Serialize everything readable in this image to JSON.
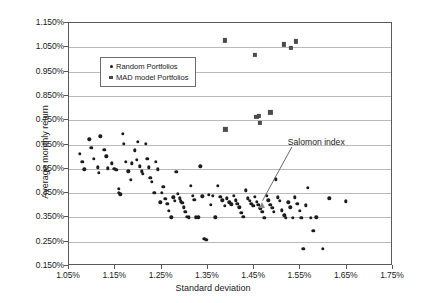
{
  "chart_data": {
    "type": "scatter",
    "title": "",
    "xlabel": "Standard deviation",
    "ylabel": "Average monthly return",
    "xlim": [
      1.05,
      1.75
    ],
    "ylim": [
      0.15,
      1.15
    ],
    "xticks": [
      "1.05%",
      "1.15%",
      "1.25%",
      "1.35%",
      "1.45%",
      "1.55%",
      "1.65%",
      "1.75%"
    ],
    "xtick_values": [
      1.05,
      1.15,
      1.25,
      1.35,
      1.45,
      1.55,
      1.65,
      1.75
    ],
    "yticks": [
      "0.150%",
      "0.250%",
      "0.350%",
      "0.450%",
      "0.550%",
      "0.650%",
      "0.750%",
      "0.850%",
      "0.950%",
      "1.050%",
      "1.150%"
    ],
    "ytick_values": [
      0.15,
      0.25,
      0.35,
      0.45,
      0.55,
      0.65,
      0.75,
      0.85,
      0.95,
      1.05,
      1.15
    ],
    "grid": true,
    "legend_position": "upper-left-inside",
    "legend": [
      {
        "label": "Random Portfolios",
        "marker": "diamond",
        "color": "#1c1c1c"
      },
      {
        "label": "MAD model Portfolios",
        "marker": "square",
        "color": "#4b4b4b"
      }
    ],
    "annotations": [
      {
        "text": "Salomon index",
        "marker": "triangle",
        "marker_color": "#8a8a8a",
        "point": [
          1.468,
          0.402
        ],
        "label_at": [
          1.525,
          0.652
        ]
      }
    ],
    "series": [
      {
        "name": "Random Portfolios",
        "marker": "diamond",
        "color": "#1c1c1c",
        "points": [
          [
            1.073,
            0.612
          ],
          [
            1.079,
            0.578
          ],
          [
            1.083,
            0.548
          ],
          [
            1.094,
            0.672
          ],
          [
            1.098,
            0.636
          ],
          [
            1.104,
            0.592
          ],
          [
            1.112,
            0.556
          ],
          [
            1.115,
            0.534
          ],
          [
            1.118,
            0.684
          ],
          [
            1.126,
            0.628
          ],
          [
            1.131,
            0.601
          ],
          [
            1.134,
            0.552
          ],
          [
            1.142,
            0.572
          ],
          [
            1.148,
            0.551
          ],
          [
            1.152,
            0.546
          ],
          [
            1.157,
            0.467
          ],
          [
            1.158,
            0.452
          ],
          [
            1.161,
            0.445
          ],
          [
            1.166,
            0.694
          ],
          [
            1.169,
            0.652
          ],
          [
            1.173,
            0.578
          ],
          [
            1.178,
            0.54
          ],
          [
            1.183,
            0.505
          ],
          [
            1.186,
            0.572
          ],
          [
            1.192,
            0.626
          ],
          [
            1.196,
            0.588
          ],
          [
            1.199,
            0.662
          ],
          [
            1.203,
            0.56
          ],
          [
            1.207,
            0.54
          ],
          [
            1.21,
            0.529
          ],
          [
            1.216,
            0.654
          ],
          [
            1.219,
            0.592
          ],
          [
            1.222,
            0.556
          ],
          [
            1.226,
            0.512
          ],
          [
            1.229,
            0.497
          ],
          [
            1.234,
            0.452
          ],
          [
            1.238,
            0.578
          ],
          [
            1.242,
            0.548
          ],
          [
            1.247,
            0.412
          ],
          [
            1.251,
            0.45
          ],
          [
            1.254,
            0.475
          ],
          [
            1.258,
            0.427
          ],
          [
            1.262,
            0.405
          ],
          [
            1.266,
            0.378
          ],
          [
            1.271,
            0.35
          ],
          [
            1.275,
            0.432
          ],
          [
            1.278,
            0.418
          ],
          [
            1.282,
            0.538
          ],
          [
            1.285,
            0.446
          ],
          [
            1.289,
            0.428
          ],
          [
            1.292,
            0.416
          ],
          [
            1.295,
            0.409
          ],
          [
            1.298,
            0.392
          ],
          [
            1.301,
            0.374
          ],
          [
            1.305,
            0.352
          ],
          [
            1.309,
            0.35
          ],
          [
            1.313,
            0.48
          ],
          [
            1.317,
            0.438
          ],
          [
            1.321,
            0.423
          ],
          [
            1.324,
            0.35
          ],
          [
            1.329,
            0.351
          ],
          [
            1.334,
            0.56
          ],
          [
            1.338,
            0.437
          ],
          [
            1.342,
            0.262
          ],
          [
            1.347,
            0.258
          ],
          [
            1.352,
            0.442
          ],
          [
            1.356,
            0.402
          ],
          [
            1.361,
            0.439
          ],
          [
            1.366,
            0.35
          ],
          [
            1.372,
            0.48
          ],
          [
            1.377,
            0.435
          ],
          [
            1.381,
            0.42
          ],
          [
            1.386,
            0.398
          ],
          [
            1.391,
            0.428
          ],
          [
            1.396,
            0.412
          ],
          [
            1.401,
            0.404
          ],
          [
            1.406,
            0.439
          ],
          [
            1.41,
            0.42
          ],
          [
            1.414,
            0.405
          ],
          [
            1.418,
            0.392
          ],
          [
            1.422,
            0.37
          ],
          [
            1.427,
            0.352
          ],
          [
            1.432,
            0.462
          ],
          [
            1.436,
            0.428
          ],
          [
            1.44,
            0.419
          ],
          [
            1.444,
            0.406
          ],
          [
            1.448,
            0.398
          ],
          [
            1.452,
            0.436
          ],
          [
            1.456,
            0.415
          ],
          [
            1.459,
            0.402
          ],
          [
            1.463,
            0.388
          ],
          [
            1.468,
            0.372
          ],
          [
            1.472,
            0.348
          ],
          [
            1.477,
            0.438
          ],
          [
            1.481,
            0.42
          ],
          [
            1.485,
            0.402
          ],
          [
            1.489,
            0.39
          ],
          [
            1.493,
            0.374
          ],
          [
            1.497,
            0.506
          ],
          [
            1.501,
            0.432
          ],
          [
            1.505,
            0.418
          ],
          [
            1.51,
            0.38
          ],
          [
            1.515,
            0.358
          ],
          [
            1.519,
            0.348
          ],
          [
            1.524,
            0.412
          ],
          [
            1.528,
            0.392
          ],
          [
            1.533,
            0.348
          ],
          [
            1.538,
            0.432
          ],
          [
            1.543,
            0.406
          ],
          [
            1.548,
            0.378
          ],
          [
            1.552,
            0.348
          ],
          [
            1.556,
            0.222
          ],
          [
            1.562,
            0.4
          ],
          [
            1.566,
            0.472
          ],
          [
            1.572,
            0.348
          ],
          [
            1.578,
            0.296
          ],
          [
            1.584,
            0.35
          ],
          [
            1.598,
            0.222
          ],
          [
            1.612,
            0.428
          ],
          [
            1.648,
            0.416
          ]
        ]
      },
      {
        "name": "MAD model Portfolios",
        "marker": "square",
        "color": "#4b4b4b",
        "points": [
          [
            1.386,
            1.078
          ],
          [
            1.452,
            1.018
          ],
          [
            1.515,
            1.062
          ],
          [
            1.53,
            1.048
          ],
          [
            1.541,
            1.074
          ],
          [
            1.388,
            0.712
          ],
          [
            1.455,
            0.762
          ],
          [
            1.461,
            0.768
          ],
          [
            1.463,
            0.74
          ],
          [
            1.485,
            0.782
          ]
        ]
      }
    ]
  }
}
